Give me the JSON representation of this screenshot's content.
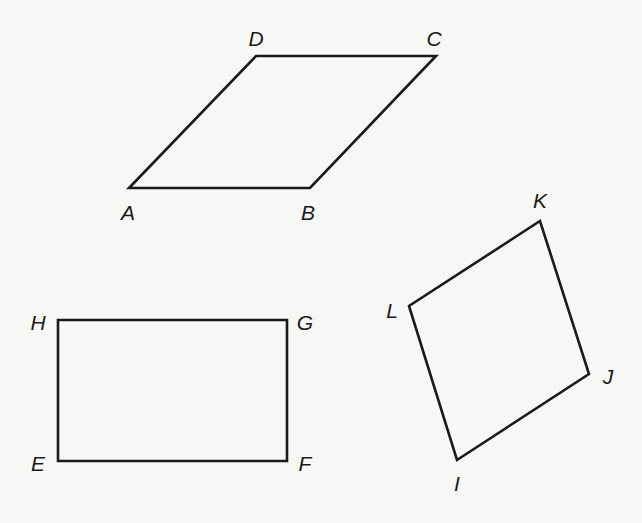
{
  "diagram": {
    "type": "geometry-quadrilaterals",
    "background": "#f7f7f5",
    "stroke_color": "#1a1a1a",
    "shapes": [
      {
        "name": "parallelogram-ABCD",
        "vertices": [
          {
            "label": "A",
            "x": 129,
            "y": 188,
            "lx": 128,
            "ly": 220
          },
          {
            "label": "B",
            "x": 310,
            "y": 188,
            "lx": 308,
            "ly": 220
          },
          {
            "label": "C",
            "x": 436,
            "y": 56,
            "lx": 434,
            "ly": 46
          },
          {
            "label": "D",
            "x": 256,
            "y": 56,
            "lx": 256,
            "ly": 46
          }
        ]
      },
      {
        "name": "rectangle-EFGH",
        "vertices": [
          {
            "label": "E",
            "x": 58,
            "y": 461,
            "lx": 38,
            "ly": 471
          },
          {
            "label": "F",
            "x": 287,
            "y": 461,
            "lx": 305,
            "ly": 471
          },
          {
            "label": "G",
            "x": 287,
            "y": 320,
            "lx": 305,
            "ly": 330
          },
          {
            "label": "H",
            "x": 58,
            "y": 320,
            "lx": 38,
            "ly": 330
          }
        ]
      },
      {
        "name": "quadrilateral-IJKL",
        "vertices": [
          {
            "label": "I",
            "x": 457,
            "y": 460,
            "lx": 457,
            "ly": 491
          },
          {
            "label": "J",
            "x": 589,
            "y": 374,
            "lx": 608,
            "ly": 384
          },
          {
            "label": "K",
            "x": 540,
            "y": 221,
            "lx": 540,
            "ly": 208
          },
          {
            "label": "L",
            "x": 409,
            "y": 306,
            "lx": 392,
            "ly": 318
          }
        ]
      }
    ]
  }
}
